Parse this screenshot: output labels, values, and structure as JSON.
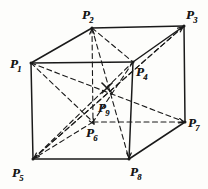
{
  "figure": {
    "kind": "line-diagram",
    "canvas": {
      "width": 208,
      "height": 189
    },
    "ink_color": "#1a1a1a",
    "background_color": "#fdfdfb",
    "solid_stroke_width": 1.5,
    "dashed_stroke_width": 1.1,
    "dash_pattern": "5,3.5"
  },
  "vertices": [
    {
      "id": "P1",
      "base": "P",
      "sub": "1",
      "x": 31,
      "y": 63,
      "label_x": 10,
      "label_y": 55,
      "hidden": false,
      "position": "front-top-left"
    },
    {
      "id": "P2",
      "base": "P",
      "sub": "2",
      "x": 92,
      "y": 28,
      "label_x": 82,
      "label_y": 6,
      "hidden": false,
      "position": "back-top-left"
    },
    {
      "id": "P3",
      "base": "P",
      "sub": "3",
      "x": 184,
      "y": 26,
      "label_x": 186,
      "label_y": 6,
      "hidden": false,
      "position": "back-top-right"
    },
    {
      "id": "P4",
      "base": "P",
      "sub": "4",
      "x": 133,
      "y": 62,
      "label_x": 136,
      "label_y": 63,
      "hidden": false,
      "position": "front-top-right"
    },
    {
      "id": "P5",
      "base": "P",
      "sub": "5",
      "x": 33,
      "y": 159,
      "label_x": 12,
      "label_y": 164,
      "hidden": false,
      "position": "front-bottom-left"
    },
    {
      "id": "P6",
      "base": "P",
      "sub": "6",
      "x": 93,
      "y": 122,
      "label_x": 86,
      "label_y": 124,
      "hidden": true,
      "position": "back-bottom-left"
    },
    {
      "id": "P7",
      "base": "P",
      "sub": "7",
      "x": 185,
      "y": 122,
      "label_x": 188,
      "label_y": 114,
      "hidden": false,
      "position": "back-bottom-right"
    },
    {
      "id": "P8",
      "base": "P",
      "sub": "8",
      "x": 129,
      "y": 159,
      "label_x": 130,
      "label_y": 163,
      "hidden": false,
      "position": "front-bottom-right"
    },
    {
      "id": "P9",
      "base": "P",
      "sub": "9",
      "x": 107,
      "y": 93,
      "label_x": 98,
      "label_y": 99,
      "hidden": true,
      "position": "center"
    }
  ],
  "edges_solid": [
    {
      "from": "P1",
      "to": "P2"
    },
    {
      "from": "P2",
      "to": "P3"
    },
    {
      "from": "P3",
      "to": "P4"
    },
    {
      "from": "P4",
      "to": "P1"
    },
    {
      "from": "P1",
      "to": "P5"
    },
    {
      "from": "P3",
      "to": "P7"
    },
    {
      "from": "P4",
      "to": "P8"
    },
    {
      "from": "P5",
      "to": "P8"
    },
    {
      "from": "P8",
      "to": "P7"
    }
  ],
  "edges_dashed": [
    {
      "from": "P2",
      "to": "P6"
    },
    {
      "from": "P6",
      "to": "P5"
    },
    {
      "from": "P6",
      "to": "P7"
    }
  ],
  "diagonals_dashed": [
    {
      "from": "P1",
      "to": "P7"
    },
    {
      "from": "P2",
      "to": "P8"
    },
    {
      "from": "P3",
      "to": "P5"
    },
    {
      "from": "P4",
      "to": "P6"
    },
    {
      "from": "P5",
      "to": "P4"
    },
    {
      "from": "P5",
      "to": "P3"
    },
    {
      "from": "P1",
      "to": "P6"
    },
    {
      "from": "P2",
      "to": "P4"
    }
  ],
  "center_marker": {
    "name": "center-cross",
    "x": 107,
    "y": 88,
    "arm": 5,
    "symbol": "x"
  },
  "arrows": [
    {
      "name": "arrow-to-P6",
      "from_x": 84,
      "from_y": 108,
      "to_x": 94,
      "to_y": 124
    },
    {
      "name": "arrow-to-P8",
      "from_x": 129,
      "from_y": 146,
      "to_x": 129,
      "to_y": 158
    },
    {
      "name": "arrow-to-P5",
      "from_x": 46,
      "from_y": 148,
      "to_x": 34,
      "to_y": 158
    },
    {
      "name": "arrow-to-P7",
      "from_x": 172,
      "from_y": 119,
      "to_x": 184,
      "to_y": 122
    },
    {
      "name": "arrow-to-P3",
      "from_x": 171,
      "from_y": 36,
      "to_x": 183,
      "to_y": 27
    },
    {
      "name": "arrow-to-P2",
      "from_x": 92,
      "from_y": 40,
      "to_x": 92,
      "to_y": 29
    }
  ]
}
